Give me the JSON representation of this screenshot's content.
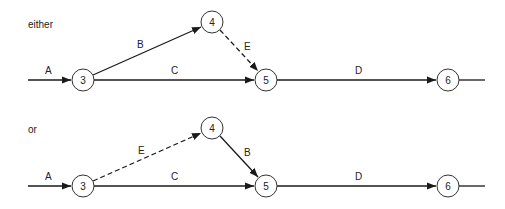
{
  "diagrams": [
    {
      "caption": "either",
      "offset_y": 0,
      "nodes": [
        {
          "id": "3",
          "label": "3",
          "x": 83,
          "y": 80
        },
        {
          "id": "4",
          "label": "4",
          "x": 212,
          "y": 22
        },
        {
          "id": "5",
          "label": "5",
          "x": 266,
          "y": 80
        },
        {
          "id": "6",
          "label": "6",
          "x": 448,
          "y": 80
        }
      ],
      "edges": [
        {
          "label": "A",
          "from": "start",
          "to": "3",
          "style": "solid"
        },
        {
          "label": "B",
          "from": "3",
          "to": "4",
          "style": "solid"
        },
        {
          "label": "C",
          "from": "3",
          "to": "5",
          "style": "solid"
        },
        {
          "label": "E",
          "from": "4",
          "to": "5",
          "style": "dashed"
        },
        {
          "label": "D",
          "from": "5",
          "to": "6",
          "style": "solid"
        },
        {
          "label": "",
          "from": "6",
          "to": "end",
          "style": "solid"
        }
      ]
    },
    {
      "caption": "or",
      "offset_y": 106,
      "nodes": [
        {
          "id": "3",
          "label": "3",
          "x": 83,
          "y": 186
        },
        {
          "id": "4",
          "label": "4",
          "x": 212,
          "y": 128
        },
        {
          "id": "5",
          "label": "5",
          "x": 266,
          "y": 186
        },
        {
          "id": "6",
          "label": "6",
          "x": 448,
          "y": 186
        }
      ],
      "edges": [
        {
          "label": "A",
          "from": "start",
          "to": "3",
          "style": "solid"
        },
        {
          "label": "E",
          "from": "3",
          "to": "4",
          "style": "dashed"
        },
        {
          "label": "C",
          "from": "3",
          "to": "5",
          "style": "solid"
        },
        {
          "label": "B",
          "from": "4",
          "to": "5",
          "style": "solid"
        },
        {
          "label": "D",
          "from": "5",
          "to": "6",
          "style": "solid"
        },
        {
          "label": "",
          "from": "6",
          "to": "end",
          "style": "solid"
        }
      ]
    }
  ]
}
